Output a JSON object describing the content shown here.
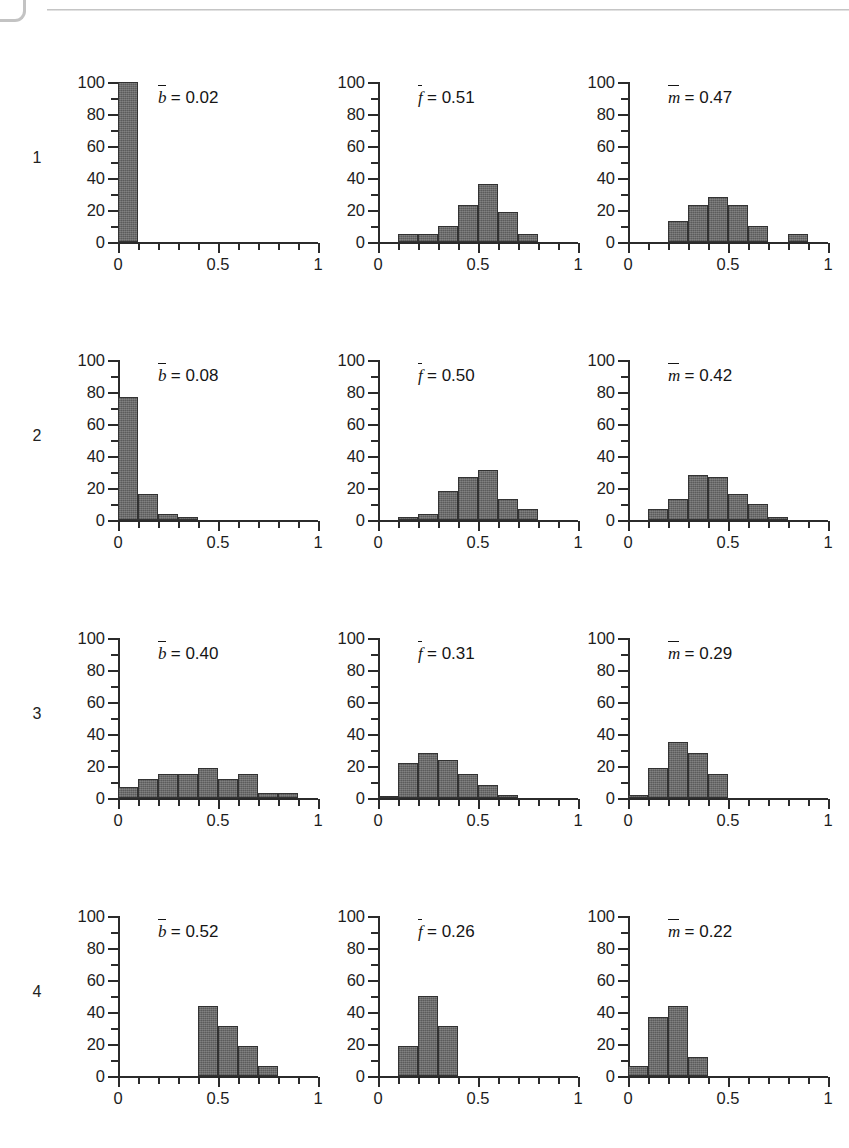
{
  "figure": {
    "row_labels": [
      "1",
      "2",
      "3",
      "4"
    ],
    "y_ticks_major": [
      0,
      20,
      40,
      60,
      80,
      100
    ],
    "y_tick_labels": [
      "0",
      "20",
      "40",
      "60",
      "80",
      "100"
    ],
    "x_ticks_major": [
      0,
      0.5,
      1
    ],
    "x_tick_labels": [
      "0",
      "0.5",
      "1"
    ],
    "bar_color": "#5b5b5b",
    "axis_color": "#2b2b2b"
  },
  "chart_data": [
    {
      "type": "bar",
      "panel": "row1-col1",
      "row": "1",
      "annotation": "b̅ = 0.02",
      "symbol": "b",
      "mean_label": "= 0.02",
      "mean_value": 0.02,
      "title": "",
      "xlabel": "",
      "ylabel": "",
      "xlim": [
        0,
        1
      ],
      "ylim": [
        0,
        100
      ],
      "bin_width": 0.1,
      "bin_starts": [
        0.0
      ],
      "categories": [
        "0.0-0.1"
      ],
      "values": [
        100
      ]
    },
    {
      "type": "bar",
      "panel": "row1-col2",
      "row": "1",
      "annotation": "f̅ = 0.51",
      "symbol": "f",
      "mean_label": "= 0.51",
      "mean_value": 0.51,
      "title": "",
      "xlabel": "",
      "ylabel": "",
      "xlim": [
        0,
        1
      ],
      "ylim": [
        0,
        100
      ],
      "bin_width": 0.1,
      "bin_starts": [
        0.1,
        0.2,
        0.3,
        0.4,
        0.5,
        0.6,
        0.7
      ],
      "categories": [
        "0.1-0.2",
        "0.2-0.3",
        "0.3-0.4",
        "0.4-0.5",
        "0.5-0.6",
        "0.6-0.7",
        "0.7-0.8"
      ],
      "values": [
        5,
        5,
        10,
        23,
        36,
        19,
        5
      ]
    },
    {
      "type": "bar",
      "panel": "row1-col3",
      "row": "1",
      "annotation": "m̅ = 0.47",
      "symbol": "m",
      "mean_label": "= 0.47",
      "mean_value": 0.47,
      "title": "",
      "xlabel": "",
      "ylabel": "",
      "xlim": [
        0,
        1
      ],
      "ylim": [
        0,
        100
      ],
      "bin_width": 0.1,
      "bin_starts": [
        0.2,
        0.3,
        0.4,
        0.5,
        0.6,
        0.8
      ],
      "categories": [
        "0.2-0.3",
        "0.3-0.4",
        "0.4-0.5",
        "0.5-0.6",
        "0.6-0.7",
        "0.8-0.9"
      ],
      "values": [
        13,
        23,
        28,
        23,
        10,
        5
      ]
    },
    {
      "type": "bar",
      "panel": "row2-col1",
      "row": "2",
      "annotation": "b̅ = 0.08",
      "symbol": "b",
      "mean_label": "= 0.08",
      "mean_value": 0.08,
      "title": "",
      "xlabel": "",
      "ylabel": "",
      "xlim": [
        0,
        1
      ],
      "ylim": [
        0,
        100
      ],
      "bin_width": 0.1,
      "bin_starts": [
        0.0,
        0.1,
        0.2,
        0.3
      ],
      "categories": [
        "0.0-0.1",
        "0.1-0.2",
        "0.2-0.3",
        "0.3-0.4"
      ],
      "values": [
        77,
        16,
        4,
        2
      ]
    },
    {
      "type": "bar",
      "panel": "row2-col2",
      "row": "2",
      "annotation": "f̅ = 0.50",
      "symbol": "f",
      "mean_label": "= 0.50",
      "mean_value": 0.5,
      "title": "",
      "xlabel": "",
      "ylabel": "",
      "xlim": [
        0,
        1
      ],
      "ylim": [
        0,
        100
      ],
      "bin_width": 0.1,
      "bin_starts": [
        0.1,
        0.2,
        0.3,
        0.4,
        0.5,
        0.6,
        0.7
      ],
      "categories": [
        "0.1-0.2",
        "0.2-0.3",
        "0.3-0.4",
        "0.4-0.5",
        "0.5-0.6",
        "0.6-0.7",
        "0.7-0.8"
      ],
      "values": [
        2,
        4,
        18,
        27,
        31,
        13,
        7
      ]
    },
    {
      "type": "bar",
      "panel": "row2-col3",
      "row": "2",
      "annotation": "m̅ = 0.42",
      "symbol": "m",
      "mean_label": "= 0.42",
      "mean_value": 0.42,
      "title": "",
      "xlabel": "",
      "ylabel": "",
      "xlim": [
        0,
        1
      ],
      "ylim": [
        0,
        100
      ],
      "bin_width": 0.1,
      "bin_starts": [
        0.1,
        0.2,
        0.3,
        0.4,
        0.5,
        0.6,
        0.7
      ],
      "categories": [
        "0.1-0.2",
        "0.2-0.3",
        "0.3-0.4",
        "0.4-0.5",
        "0.5-0.6",
        "0.6-0.7",
        "0.7-0.8"
      ],
      "values": [
        7,
        13,
        28,
        27,
        16,
        10,
        2
      ]
    },
    {
      "type": "bar",
      "panel": "row3-col1",
      "row": "3",
      "annotation": "b̅ = 0.40",
      "symbol": "b",
      "mean_label": "= 0.40",
      "mean_value": 0.4,
      "title": "",
      "xlabel": "",
      "ylabel": "",
      "xlim": [
        0,
        1
      ],
      "ylim": [
        0,
        100
      ],
      "bin_width": 0.1,
      "bin_starts": [
        0.0,
        0.1,
        0.2,
        0.3,
        0.4,
        0.5,
        0.6,
        0.7,
        0.8
      ],
      "categories": [
        "0.0-0.1",
        "0.1-0.2",
        "0.2-0.3",
        "0.3-0.4",
        "0.4-0.5",
        "0.5-0.6",
        "0.6-0.7",
        "0.7-0.8",
        "0.8-0.9"
      ],
      "values": [
        7,
        12,
        15,
        15,
        19,
        12,
        15,
        3,
        3
      ]
    },
    {
      "type": "bar",
      "panel": "row3-col2",
      "row": "3",
      "annotation": "f̅ = 0.31",
      "symbol": "f",
      "mean_label": "= 0.31",
      "mean_value": 0.31,
      "title": "",
      "xlabel": "",
      "ylabel": "",
      "xlim": [
        0,
        1
      ],
      "ylim": [
        0,
        100
      ],
      "bin_width": 0.1,
      "bin_starts": [
        0.0,
        0.1,
        0.2,
        0.3,
        0.4,
        0.5,
        0.6
      ],
      "categories": [
        "0.0-0.1",
        "0.1-0.2",
        "0.2-0.3",
        "0.3-0.4",
        "0.4-0.5",
        "0.5-0.6",
        "0.6-0.7"
      ],
      "values": [
        1,
        22,
        28,
        24,
        15,
        8,
        2
      ]
    },
    {
      "type": "bar",
      "panel": "row3-col3",
      "row": "3",
      "annotation": "m̅ = 0.29",
      "symbol": "m",
      "mean_label": "= 0.29",
      "mean_value": 0.29,
      "title": "",
      "xlabel": "",
      "ylabel": "",
      "xlim": [
        0,
        1
      ],
      "ylim": [
        0,
        100
      ],
      "bin_width": 0.1,
      "bin_starts": [
        0.0,
        0.1,
        0.2,
        0.3,
        0.4
      ],
      "categories": [
        "0.0-0.1",
        "0.1-0.2",
        "0.2-0.3",
        "0.3-0.4",
        "0.4-0.5"
      ],
      "values": [
        2,
        19,
        35,
        28,
        15
      ]
    },
    {
      "type": "bar",
      "panel": "row4-col1",
      "row": "4",
      "annotation": "b̅ = 0.52",
      "symbol": "b",
      "mean_label": "= 0.52",
      "mean_value": 0.52,
      "title": "",
      "xlabel": "",
      "ylabel": "",
      "xlim": [
        0,
        1
      ],
      "ylim": [
        0,
        100
      ],
      "bin_width": 0.1,
      "bin_starts": [
        0.4,
        0.5,
        0.6,
        0.7
      ],
      "categories": [
        "0.4-0.5",
        "0.5-0.6",
        "0.6-0.7",
        "0.7-0.8"
      ],
      "values": [
        44,
        31,
        19,
        6
      ]
    },
    {
      "type": "bar",
      "panel": "row4-col2",
      "row": "4",
      "annotation": "f̅ = 0.26",
      "symbol": "f",
      "mean_label": "= 0.26",
      "mean_value": 0.26,
      "title": "",
      "xlabel": "",
      "ylabel": "",
      "xlim": [
        0,
        1
      ],
      "ylim": [
        0,
        100
      ],
      "bin_width": 0.1,
      "bin_starts": [
        0.1,
        0.2,
        0.3
      ],
      "categories": [
        "0.1-0.2",
        "0.2-0.3",
        "0.3-0.4"
      ],
      "values": [
        19,
        50,
        31
      ]
    },
    {
      "type": "bar",
      "panel": "row4-col3",
      "row": "4",
      "annotation": "m̅ = 0.22",
      "symbol": "m",
      "mean_label": "= 0.22",
      "mean_value": 0.22,
      "title": "",
      "xlabel": "",
      "ylabel": "",
      "xlim": [
        0,
        1
      ],
      "ylim": [
        0,
        100
      ],
      "bin_width": 0.1,
      "bin_starts": [
        0.0,
        0.1,
        0.2,
        0.3
      ],
      "categories": [
        "0.0-0.1",
        "0.1-0.2",
        "0.2-0.3",
        "0.3-0.4"
      ],
      "values": [
        6,
        37,
        44,
        12
      ]
    }
  ]
}
